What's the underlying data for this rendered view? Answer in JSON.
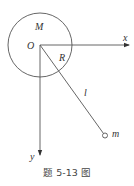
{
  "diagram": {
    "labels": {
      "mass_disk": "M",
      "origin": "O",
      "radius": "R",
      "rod_length": "l",
      "point_mass": "m",
      "x_axis": "x",
      "y_axis": "y"
    },
    "caption": "题 5-13 图",
    "colors": {
      "stroke": "#555555",
      "text": "#333333",
      "background": "#ffffff"
    }
  }
}
